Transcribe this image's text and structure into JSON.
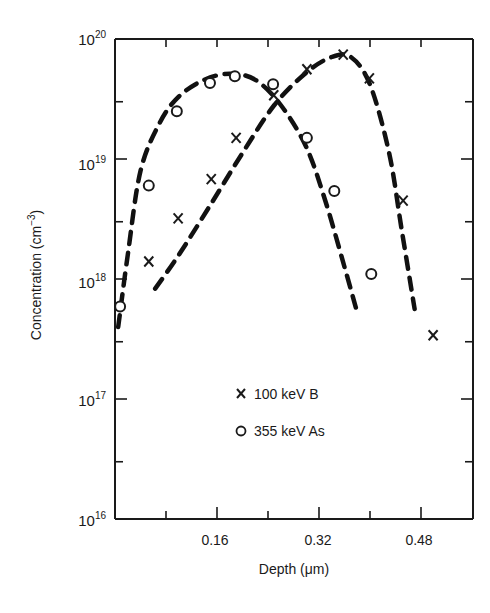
{
  "chart_data": {
    "type": "scatter",
    "title": "",
    "xlabel": "Depth (µm)",
    "ylabel": "Concentration (cm⁻³)",
    "xscale": "linear",
    "yscale": "log",
    "xlim": [
      0,
      0.56
    ],
    "ylim": [
      1e+16,
      1e+20
    ],
    "x_ticks": [
      0.08,
      0.16,
      0.24,
      0.32,
      0.4,
      0.48
    ],
    "x_tick_labels": [
      "0.16",
      "0.32",
      "0.48"
    ],
    "y_tick_labels": [
      "10^16",
      "10^17",
      "10^18",
      "10^19",
      "10^20"
    ],
    "grid": false,
    "legend_position": "lower-center-inside",
    "series": [
      {
        "name": "100 keV B",
        "marker": "x",
        "points": [
          {
            "x": 0.053,
            "y": 1.4e+18
          },
          {
            "x": 0.099,
            "y": 3.2e+18
          },
          {
            "x": 0.151,
            "y": 6.8e+18
          },
          {
            "x": 0.19,
            "y": 1.5e+19
          },
          {
            "x": 0.249,
            "y": 3.4e+19
          },
          {
            "x": 0.301,
            "y": 5.6e+19
          },
          {
            "x": 0.358,
            "y": 7.4e+19
          },
          {
            "x": 0.399,
            "y": 4.7e+19
          },
          {
            "x": 0.452,
            "y": 4.5e+18
          },
          {
            "x": 0.499,
            "y": 3.4e+17
          }
        ],
        "fit_curve": [
          [
            0.063,
            17.92
          ],
          [
            0.1,
            18.2
          ],
          [
            0.15,
            18.62
          ],
          [
            0.2,
            19.05
          ],
          [
            0.25,
            19.45
          ],
          [
            0.3,
            19.72
          ],
          [
            0.34,
            19.85
          ],
          [
            0.37,
            19.85
          ],
          [
            0.4,
            19.62
          ],
          [
            0.43,
            19.05
          ],
          [
            0.45,
            18.4
          ],
          [
            0.47,
            17.75
          ]
        ]
      },
      {
        "name": "355 keV As",
        "marker": "o",
        "points": [
          {
            "x": 0.008,
            "y": 5.9e+17
          },
          {
            "x": 0.053,
            "y": 6e+18
          },
          {
            "x": 0.097,
            "y": 2.5e+19
          },
          {
            "x": 0.149,
            "y": 4.3e+19
          },
          {
            "x": 0.188,
            "y": 4.9e+19
          },
          {
            "x": 0.248,
            "y": 4.2e+19
          },
          {
            "x": 0.301,
            "y": 1.5e+19
          },
          {
            "x": 0.344,
            "y": 5.4e+18
          },
          {
            "x": 0.402,
            "y": 1.1e+18
          }
        ],
        "fit_curve": [
          [
            0.005,
            17.6
          ],
          [
            0.02,
            18.2
          ],
          [
            0.04,
            18.9
          ],
          [
            0.07,
            19.3
          ],
          [
            0.1,
            19.52
          ],
          [
            0.14,
            19.66
          ],
          [
            0.18,
            19.71
          ],
          [
            0.22,
            19.66
          ],
          [
            0.26,
            19.45
          ],
          [
            0.3,
            19.1
          ],
          [
            0.33,
            18.65
          ],
          [
            0.36,
            18.1
          ],
          [
            0.38,
            17.72
          ]
        ]
      }
    ]
  },
  "axes": {
    "xlabel": "Depth (",
    "xlabel_mu": "μ",
    "xlabel_end": "m)",
    "ylabel": "Concentration (cm",
    "ylabel_exp": "−3",
    "ylabel_end": ")",
    "y_base": "10",
    "y_exps": [
      "20",
      "19",
      "18",
      "17",
      "16"
    ],
    "x_labels": [
      "0.16",
      "0.32",
      "0.48"
    ]
  },
  "legend": {
    "items": [
      {
        "symbol": "X",
        "label": "100 keV B"
      },
      {
        "symbol": "O",
        "label": "355 keV As"
      }
    ]
  }
}
